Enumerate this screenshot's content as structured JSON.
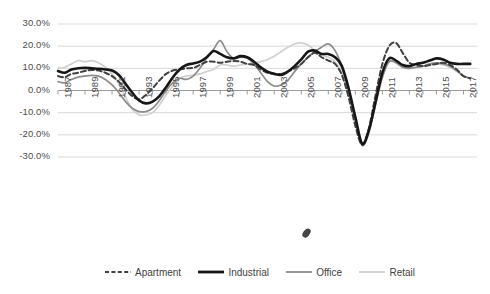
{
  "chart_data": {
    "type": "line",
    "title": "",
    "xlabel": "",
    "ylabel": "",
    "ylim": [
      -30,
      30
    ],
    "ytick_labels": [
      "30.0%",
      "20.0%",
      "10.0%",
      "0.0%",
      "-10.0%",
      "-20.0%",
      "-30.0%"
    ],
    "ytick_values": [
      30,
      20,
      10,
      0,
      -10,
      -20,
      -30
    ],
    "xlim": [
      1987,
      2018
    ],
    "xtick_labels": [
      "1987",
      "1989",
      "1991",
      "1993",
      "1995",
      "1997",
      "1999",
      "2001",
      "2003",
      "2005",
      "2007",
      "2009",
      "2011",
      "2013",
      "2015",
      "2017"
    ],
    "xtick_values": [
      1987,
      1989,
      1991,
      1993,
      1995,
      1997,
      1999,
      2001,
      2003,
      2005,
      2007,
      2009,
      2011,
      2013,
      2015,
      2017
    ],
    "grid": true,
    "legend_position": "bottom",
    "x": [
      1987,
      1987.5,
      1988,
      1988.5,
      1989,
      1989.5,
      1990,
      1990.5,
      1991,
      1991.5,
      1992,
      1992.5,
      1993,
      1993.5,
      1994,
      1994.5,
      1995,
      1995.5,
      1996,
      1996.5,
      1997,
      1997.5,
      1998,
      1998.5,
      1999,
      1999.5,
      2000,
      2000.5,
      2001,
      2001.5,
      2002,
      2002.5,
      2003,
      2003.5,
      2004,
      2004.5,
      2005,
      2005.5,
      2006,
      2006.5,
      2007,
      2007.5,
      2008,
      2008.5,
      2009,
      2009.5,
      2010,
      2010.5,
      2011,
      2011.5,
      2012,
      2012.5,
      2013,
      2013.5,
      2014,
      2014.5,
      2015,
      2015.5,
      2016,
      2016.5,
      2017,
      2017.5
    ],
    "series": [
      {
        "name": "Apartment",
        "color": "#404040",
        "style": "dashed",
        "width": 2.0,
        "values": [
          6.5,
          6.0,
          7.5,
          8.0,
          8.8,
          9.2,
          9.0,
          8.0,
          6.5,
          4.0,
          0.5,
          -2.5,
          -4.0,
          -2.0,
          1.0,
          4.5,
          7.5,
          9.0,
          9.5,
          10.0,
          10.2,
          11.5,
          13.0,
          13.0,
          12.5,
          13.0,
          13.3,
          13.0,
          12.0,
          11.5,
          9.5,
          8.0,
          7.5,
          7.5,
          8.5,
          10.0,
          12.0,
          15.0,
          17.0,
          15.0,
          13.5,
          12.0,
          7.0,
          -3.0,
          -16.0,
          -24.5,
          -17.0,
          -2.0,
          12.0,
          20.0,
          21.5,
          17.0,
          12.5,
          11.5,
          11.0,
          11.5,
          12.0,
          12.5,
          11.5,
          9.5,
          6.5,
          5.5
        ]
      },
      {
        "name": "Industrial",
        "color": "#161616",
        "style": "solid",
        "width": 2.6,
        "values": [
          8.8,
          8.0,
          9.5,
          10.0,
          10.2,
          10.0,
          9.8,
          9.5,
          9.0,
          7.0,
          3.0,
          -1.0,
          -4.5,
          -5.8,
          -5.0,
          -2.5,
          1.5,
          6.0,
          9.5,
          11.5,
          12.2,
          13.0,
          15.0,
          17.8,
          16.5,
          15.0,
          14.5,
          15.5,
          15.0,
          13.0,
          10.5,
          8.5,
          7.5,
          7.0,
          8.5,
          11.0,
          14.0,
          17.5,
          18.0,
          16.5,
          16.5,
          15.0,
          11.0,
          1.0,
          -12.0,
          -24.0,
          -18.0,
          -5.0,
          8.0,
          14.5,
          13.5,
          11.5,
          11.0,
          12.0,
          12.5,
          13.5,
          14.5,
          14.0,
          12.5,
          12.0,
          12.0,
          12.0
        ]
      },
      {
        "name": "Office",
        "color": "#8c8c8c",
        "style": "solid",
        "width": 1.7,
        "values": [
          4.0,
          3.5,
          5.0,
          6.0,
          6.5,
          6.8,
          6.5,
          5.0,
          2.5,
          -1.0,
          -5.0,
          -8.0,
          -9.5,
          -9.5,
          -8.0,
          -4.5,
          0.0,
          3.5,
          5.5,
          5.0,
          6.5,
          10.0,
          14.5,
          18.5,
          22.5,
          17.5,
          14.5,
          15.0,
          14.5,
          12.0,
          8.0,
          4.0,
          2.0,
          2.5,
          4.5,
          8.5,
          12.0,
          15.0,
          17.5,
          19.5,
          21.0,
          18.0,
          11.0,
          0.0,
          -13.0,
          -24.5,
          -18.5,
          -6.0,
          6.0,
          13.0,
          12.5,
          10.5,
          10.0,
          10.5,
          11.0,
          12.0,
          12.5,
          12.0,
          11.0,
          9.0,
          6.5,
          5.5
        ]
      },
      {
        "name": "Retail",
        "color": "#d0d0d0",
        "style": "solid",
        "width": 1.7,
        "values": [
          10.0,
          10.5,
          12.0,
          13.5,
          13.0,
          13.5,
          12.5,
          10.5,
          7.5,
          3.0,
          -3.0,
          -8.5,
          -11.0,
          -11.0,
          -10.0,
          -6.5,
          -2.0,
          2.0,
          5.5,
          6.5,
          7.0,
          7.5,
          8.5,
          9.5,
          11.5,
          11.5,
          11.0,
          11.5,
          12.0,
          12.5,
          13.0,
          14.0,
          15.5,
          17.5,
          19.5,
          21.0,
          21.5,
          20.5,
          18.0,
          16.0,
          15.0,
          13.0,
          8.0,
          -1.0,
          -14.0,
          -25.0,
          -19.0,
          -6.5,
          6.0,
          13.5,
          12.5,
          10.5,
          10.0,
          10.5,
          11.0,
          11.5,
          12.0,
          11.5,
          10.5,
          8.5,
          6.5,
          5.5
        ]
      }
    ]
  },
  "legend": {
    "items": [
      {
        "label": "Apartment"
      },
      {
        "label": "Industrial"
      },
      {
        "label": "Office"
      },
      {
        "label": "Retail"
      }
    ]
  },
  "colors": {
    "apartment": "#404040",
    "industrial": "#161616",
    "office": "#8c8c8c",
    "retail": "#d0d0d0",
    "grid": "#d9d9d9",
    "axis": "#9a9a9a",
    "text": "#3f3f3f"
  }
}
